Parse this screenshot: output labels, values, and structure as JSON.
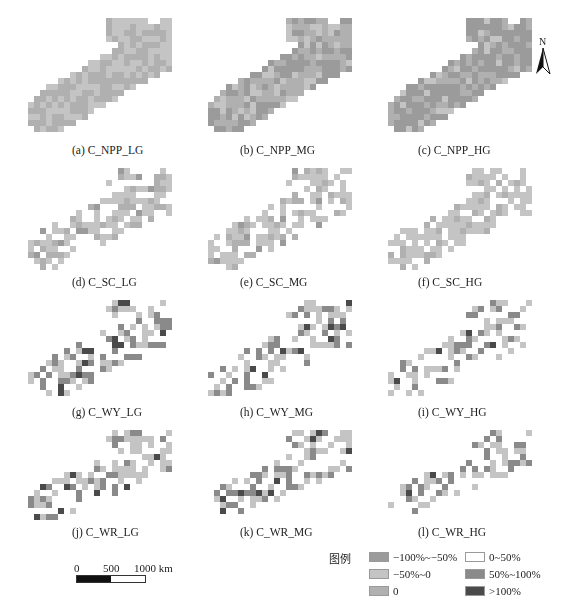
{
  "figure": {
    "panels": [
      {
        "id": "a",
        "caption": "(a) C_NPP_LG",
        "group": "NPP",
        "level": "LG"
      },
      {
        "id": "b",
        "caption": "(b) C_NPP_MG",
        "group": "NPP",
        "level": "MG"
      },
      {
        "id": "c",
        "caption": "(c) C_NPP_HG",
        "group": "NPP",
        "level": "HG"
      },
      {
        "id": "d",
        "caption": "(d) C_SC_LG",
        "group": "SC",
        "level": "LG"
      },
      {
        "id": "e",
        "caption": "(e) C_SC_MG",
        "group": "SC",
        "level": "MG"
      },
      {
        "id": "f",
        "caption": "(f) C_SC_HG",
        "group": "SC",
        "level": "HG"
      },
      {
        "id": "g",
        "caption": "(g) C_WY_LG",
        "group": "WY",
        "level": "LG"
      },
      {
        "id": "h",
        "caption": "(h) C_WY_MG",
        "group": "WY",
        "level": "MG"
      },
      {
        "id": "i",
        "caption": "(i) C_WY_HG",
        "group": "WY",
        "level": "HG"
      },
      {
        "id": "j",
        "caption": "(j) C_WR_LG",
        "group": "WR",
        "level": "LG"
      },
      {
        "id": "k",
        "caption": "(k) C_WR_MG",
        "group": "WR",
        "level": "MG"
      },
      {
        "id": "l",
        "caption": "(l) C_WR_HG",
        "group": "WR",
        "level": "HG"
      }
    ],
    "north_arrow": {
      "label": "N"
    },
    "scale_bar": {
      "ticks": [
        "0",
        "500",
        "1000 km"
      ]
    },
    "legend": {
      "title": "图例",
      "items": [
        {
          "label": "−100%~−50%",
          "color": "#9b9b9b"
        },
        {
          "label": "−50%~0",
          "color": "#c4c4c4"
        },
        {
          "label": "0",
          "color": "#b0b0b0"
        },
        {
          "label": "0~50%",
          "color": "#ffffff"
        },
        {
          "label": "50%~100%",
          "color": "#8a8a8a"
        },
        {
          "label": ">100%",
          "color": "#4a4a4a"
        }
      ]
    }
  }
}
